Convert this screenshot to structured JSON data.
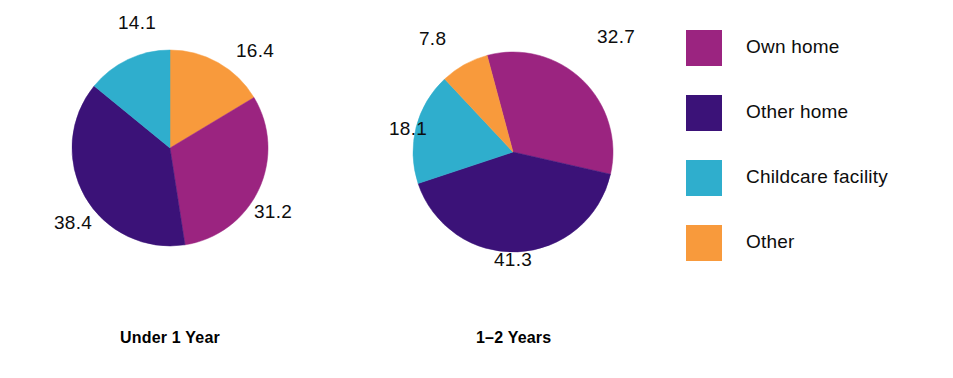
{
  "chart_data": {
    "type": "pie",
    "title": "",
    "subtitle": "",
    "xlabel": "",
    "ylabel": "",
    "grid": false,
    "legend_position": "right",
    "units": "percent",
    "categories": [
      "Own home",
      "Other home",
      "Childcare facility",
      "Other"
    ],
    "colors": {
      "own_home": "#9B2480",
      "other_home": "#3B1278",
      "childcare_facility": "#2FAECD",
      "other": "#F89A3C"
    },
    "charts": [
      {
        "title": "Under 1 Year",
        "center": {
          "x": 170,
          "y": 148
        },
        "radius": 98,
        "start_angle": 0,
        "slices": [
          {
            "label": "Other",
            "value": 16.4,
            "display": "16.4",
            "color": "#F89A3C",
            "label_x": 255,
            "label_y": 50
          },
          {
            "label": "Own home",
            "value": 31.2,
            "display": "31.2",
            "color": "#9B2480",
            "label_x": 273,
            "label_y": 211
          },
          {
            "label": "Other home",
            "value": 38.4,
            "display": "38.4",
            "color": "#3B1278",
            "label_x": 73,
            "label_y": 222
          },
          {
            "label": "Childcare facility",
            "value": 14.1,
            "display": "14.1",
            "color": "#2FAECD",
            "label_x": 137,
            "label_y": 22
          }
        ]
      },
      {
        "title": "1–2 Years",
        "center": {
          "x": 513,
          "y": 152
        },
        "radius": 100,
        "start_angle": -15,
        "slices": [
          {
            "label": "Own home",
            "value": 32.7,
            "display": "32.7",
            "color": "#9B2480",
            "label_x": 616,
            "label_y": 36
          },
          {
            "label": "Other home",
            "value": 41.3,
            "display": "41.3",
            "color": "#3B1278",
            "label_x": 513,
            "label_y": 259
          },
          {
            "label": "Childcare facility",
            "value": 18.1,
            "display": "18.1",
            "color": "#2FAECD",
            "label_x": 408,
            "label_y": 128
          },
          {
            "label": "Other",
            "value": 7.8,
            "display": "7.8",
            "color": "#F89A3C",
            "label_x": 432,
            "label_y": 38
          }
        ]
      }
    ]
  },
  "legend": {
    "items": [
      {
        "label": "Own home",
        "color": "#9B2480"
      },
      {
        "label": "Other home",
        "color": "#3B1278"
      },
      {
        "label": "Childcare facility",
        "color": "#2FAECD"
      },
      {
        "label": "Other",
        "color": "#F89A3C"
      }
    ]
  },
  "titles": {
    "chart_1": "Under 1 Year",
    "chart_2": "1–2 Years"
  }
}
